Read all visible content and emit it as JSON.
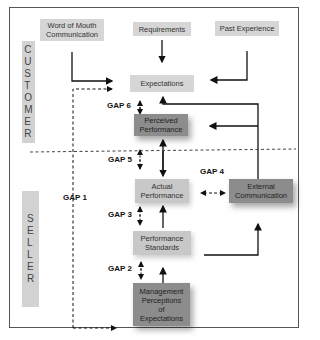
{
  "diagram": {
    "type": "service-quality-gaps-model",
    "sections": {
      "customer_label": "CUSTOMER",
      "seller_label": "SELLER"
    },
    "nodes": {
      "word_of_mouth": "Word of Mouth\nCommunication",
      "requirements": "Requirements",
      "past_experience": "Past Experience",
      "expectations": "Expectations",
      "perceived_performance": "Perceived\nPerformance",
      "actual_performance": "Actual\nPerformance",
      "external_communication": "External\nCommunication",
      "performance_standards": "Performance\nStandards",
      "management_perceptions": "Management\nPerceptions\nof\nExpectations"
    },
    "gaps": {
      "gap1": "GAP 1",
      "gap2": "GAP 2",
      "gap3": "GAP 3",
      "gap4": "GAP 4",
      "gap5": "GAP 5",
      "gap6": "GAP 6"
    },
    "edges": [
      {
        "from": "Word of Mouth Communication",
        "to": "Expectations",
        "style": "solid"
      },
      {
        "from": "Requirements",
        "to": "Expectations",
        "style": "solid"
      },
      {
        "from": "Past Experience",
        "to": "Expectations",
        "style": "solid"
      },
      {
        "from": "Expectations",
        "to": "Management Perceptions of Expectations",
        "style": "dashed",
        "label": "GAP 1"
      },
      {
        "from": "Expectations",
        "to": "Perceived Performance",
        "style": "dashed-bidirectional",
        "label": "GAP 6"
      },
      {
        "from": "Perceived Performance",
        "to": "Actual Performance",
        "style": "dashed-bidirectional",
        "label": "GAP 5"
      },
      {
        "from": "Actual Performance",
        "to": "Perceived Performance",
        "style": "solid"
      },
      {
        "from": "Actual Performance",
        "to": "External Communication",
        "style": "dashed-bidirectional",
        "label": "GAP 4"
      },
      {
        "from": "External Communication",
        "to": "Expectations",
        "style": "solid"
      },
      {
        "from": "External Communication",
        "to": "Perceived Performance",
        "style": "solid"
      },
      {
        "from": "Performance Standards",
        "to": "Actual Performance",
        "style": "solid"
      },
      {
        "from": "Actual Performance",
        "to": "Performance Standards",
        "style": "dashed-bidirectional",
        "label": "GAP 3"
      },
      {
        "from": "Performance Standards",
        "to": "External Communication",
        "style": "solid"
      },
      {
        "from": "Management Perceptions of Expectations",
        "to": "Performance Standards",
        "style": "solid"
      },
      {
        "from": "Performance Standards",
        "to": "Management Perceptions of Expectations",
        "style": "dashed-bidirectional",
        "label": "GAP 2"
      }
    ]
  }
}
